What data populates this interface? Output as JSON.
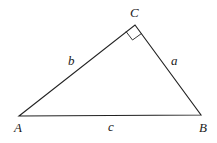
{
  "diagram": {
    "type": "right-triangle",
    "vertices": {
      "A": "A",
      "B": "B",
      "C": "C"
    },
    "sides": {
      "a": "a",
      "b": "b",
      "c": "c"
    },
    "right_angle_at": "C",
    "stroke_color": "#222222"
  }
}
